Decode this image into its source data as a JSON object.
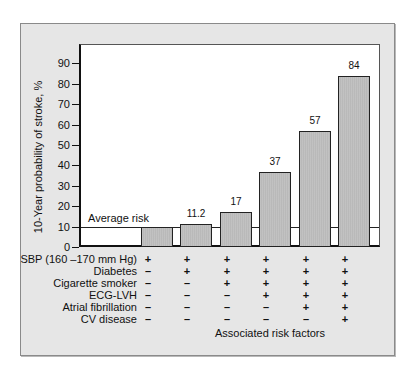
{
  "chart_data": {
    "type": "bar",
    "title": "",
    "ylabel": "10-Year probability of stroke, %",
    "xlabel": "Associated risk factors",
    "ylim": [
      0,
      95
    ],
    "yticks": [
      0,
      10,
      20,
      30,
      40,
      50,
      60,
      70,
      80,
      90
    ],
    "categories": [
      "SBP only",
      "+Diabetes",
      "+Cigarette smoker",
      "+ECG-LVH",
      "+Atrial fibrillation",
      "+CV disease"
    ],
    "values": [
      10,
      11.2,
      17,
      37,
      57,
      84
    ],
    "data_labels": [
      "",
      "11.2",
      "17",
      "37",
      "57",
      "84"
    ],
    "reference_line": {
      "label": "Average risk",
      "value": 10
    },
    "risk_factor_table": {
      "rows": [
        {
          "label": "SBP (160 –170 mm Hg)",
          "signs": [
            "+",
            "+",
            "+",
            "+",
            "+",
            "+"
          ]
        },
        {
          "label": "Diabetes",
          "signs": [
            "–",
            "+",
            "+",
            "+",
            "+",
            "+"
          ]
        },
        {
          "label": "Cigarette smoker",
          "signs": [
            "–",
            "–",
            "+",
            "+",
            "+",
            "+"
          ]
        },
        {
          "label": "ECG-LVH",
          "signs": [
            "–",
            "–",
            "–",
            "+",
            "+",
            "+"
          ]
        },
        {
          "label": "Atrial fibrillation",
          "signs": [
            "–",
            "–",
            "–",
            "–",
            "+",
            "+"
          ]
        },
        {
          "label": "CV disease",
          "signs": [
            "–",
            "–",
            "–",
            "–",
            "–",
            "+"
          ]
        }
      ]
    },
    "grid": false,
    "colors": {
      "bar": "#b9b9b9",
      "panel": "#e6e6e6",
      "plot": "#ffffff"
    }
  }
}
